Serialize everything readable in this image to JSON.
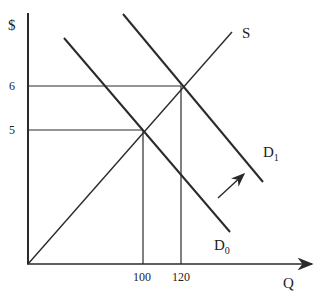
{
  "diagram": {
    "type": "supply-demand",
    "y_axis_label": "$",
    "x_axis_label": "Q",
    "price_ticks": [
      "6",
      "5"
    ],
    "quantity_ticks": [
      "100",
      "120"
    ],
    "supply": {
      "label": "S"
    },
    "demand_initial": {
      "label": "D",
      "subscript": "0"
    },
    "demand_shifted": {
      "label": "D",
      "subscript": "1"
    },
    "equilibria": [
      {
        "price": 5,
        "quantity": 100,
        "curves": [
          "S",
          "D0"
        ]
      },
      {
        "price": 6,
        "quantity": 120,
        "curves": [
          "S",
          "D1"
        ]
      }
    ],
    "shift_arrow": {
      "meaning": "demand increases from D0 to D1",
      "direction": "up-right"
    },
    "colors": {
      "line": "#2a2a2a",
      "background": "#ffffff"
    }
  }
}
